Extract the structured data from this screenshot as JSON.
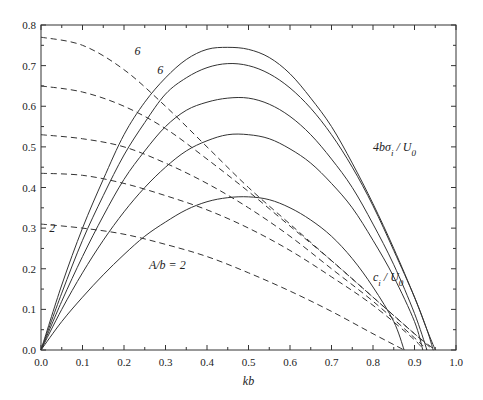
{
  "chart_data": {
    "type": "line",
    "title": "",
    "xlabel": "kb",
    "ylabel": "",
    "xlim": [
      0.0,
      1.0
    ],
    "ylim": [
      0.0,
      0.8
    ],
    "grid": false,
    "legend": "none",
    "x_ticks": [
      "0.0",
      "0.1",
      "0.2",
      "0.3",
      "0.4",
      "0.5",
      "0.6",
      "0.7",
      "0.8",
      "0.9",
      "1.0"
    ],
    "y_ticks": [
      "0.0",
      "0.1",
      "0.2",
      "0.3",
      "0.4",
      "0.5",
      "0.6",
      "0.7",
      "0.8"
    ],
    "annotations": [
      {
        "text": "6",
        "x": 0.28,
        "y": 0.68,
        "refers_to": "top solid curve"
      },
      {
        "text": "6",
        "x": 0.225,
        "y": 0.725,
        "refers_to": "top dashed curve"
      },
      {
        "text": "2",
        "x": 0.02,
        "y": 0.29,
        "refers_to": "bottom dashed curve"
      },
      {
        "text": "A/b = 2",
        "x": 0.26,
        "y": 0.2,
        "refers_to": "bottom solid curve"
      },
      {
        "text": "4bσ_i/U_0",
        "x": 0.8,
        "y": 0.49,
        "refers_to": "solid curves"
      },
      {
        "text": "c_i/U_0",
        "x": 0.8,
        "y": 0.17,
        "refers_to": "dashed curves"
      }
    ],
    "series": [
      {
        "name": "4bσ_i/U_0, A/b=6",
        "style": "solid",
        "x": [
          0,
          0.05,
          0.1,
          0.15,
          0.2,
          0.25,
          0.3,
          0.35,
          0.4,
          0.45,
          0.5,
          0.55,
          0.6,
          0.65,
          0.7,
          0.75,
          0.8,
          0.85,
          0.9,
          0.93,
          0.95
        ],
        "y": [
          0,
          0.16,
          0.3,
          0.42,
          0.53,
          0.61,
          0.67,
          0.715,
          0.74,
          0.745,
          0.74,
          0.72,
          0.68,
          0.62,
          0.55,
          0.46,
          0.36,
          0.25,
          0.13,
          0.05,
          0
        ]
      },
      {
        "name": "4bσ_i/U_0, A/b=5",
        "style": "solid",
        "x": [
          0,
          0.05,
          0.1,
          0.15,
          0.2,
          0.25,
          0.3,
          0.35,
          0.4,
          0.45,
          0.5,
          0.55,
          0.6,
          0.65,
          0.7,
          0.75,
          0.8,
          0.85,
          0.9,
          0.93,
          0.945
        ],
        "y": [
          0,
          0.14,
          0.27,
          0.38,
          0.48,
          0.56,
          0.63,
          0.67,
          0.695,
          0.705,
          0.7,
          0.68,
          0.645,
          0.595,
          0.53,
          0.45,
          0.355,
          0.245,
          0.13,
          0.05,
          0
        ]
      },
      {
        "name": "4bσ_i/U_0, A/b=4",
        "style": "solid",
        "x": [
          0,
          0.05,
          0.1,
          0.15,
          0.2,
          0.25,
          0.3,
          0.35,
          0.4,
          0.45,
          0.5,
          0.55,
          0.6,
          0.65,
          0.7,
          0.75,
          0.8,
          0.85,
          0.9,
          0.93
        ],
        "y": [
          0,
          0.12,
          0.23,
          0.33,
          0.42,
          0.49,
          0.55,
          0.59,
          0.61,
          0.62,
          0.62,
          0.605,
          0.575,
          0.53,
          0.47,
          0.4,
          0.31,
          0.21,
          0.09,
          0
        ]
      },
      {
        "name": "4bσ_i/U_0, A/b=3",
        "style": "solid",
        "x": [
          0,
          0.05,
          0.1,
          0.15,
          0.2,
          0.25,
          0.3,
          0.35,
          0.4,
          0.45,
          0.5,
          0.55,
          0.6,
          0.65,
          0.7,
          0.75,
          0.8,
          0.85,
          0.9,
          0.92
        ],
        "y": [
          0,
          0.1,
          0.19,
          0.27,
          0.34,
          0.4,
          0.45,
          0.49,
          0.515,
          0.53,
          0.53,
          0.52,
          0.495,
          0.46,
          0.41,
          0.35,
          0.27,
          0.18,
          0.07,
          0
        ]
      },
      {
        "name": "4bσ_i/U_0, A/b=2",
        "style": "solid",
        "x": [
          0,
          0.05,
          0.1,
          0.15,
          0.2,
          0.25,
          0.3,
          0.35,
          0.4,
          0.45,
          0.5,
          0.55,
          0.6,
          0.65,
          0.7,
          0.75,
          0.8,
          0.85,
          0.875
        ],
        "y": [
          0,
          0.07,
          0.13,
          0.185,
          0.235,
          0.28,
          0.315,
          0.345,
          0.365,
          0.375,
          0.377,
          0.37,
          0.35,
          0.32,
          0.28,
          0.225,
          0.155,
          0.07,
          0
        ]
      },
      {
        "name": "c_i/U_0, A/b=6",
        "style": "dashed",
        "x": [
          0,
          0.1,
          0.2,
          0.3,
          0.4,
          0.5,
          0.6,
          0.7,
          0.8,
          0.9,
          0.95
        ],
        "y": [
          0.77,
          0.75,
          0.69,
          0.6,
          0.5,
          0.4,
          0.31,
          0.22,
          0.13,
          0.04,
          0
        ]
      },
      {
        "name": "c_i/U_0, A/b=5",
        "style": "dashed",
        "x": [
          0,
          0.1,
          0.2,
          0.3,
          0.4,
          0.5,
          0.6,
          0.7,
          0.8,
          0.9,
          0.945
        ],
        "y": [
          0.65,
          0.635,
          0.6,
          0.545,
          0.47,
          0.39,
          0.305,
          0.22,
          0.13,
          0.04,
          0
        ]
      },
      {
        "name": "c_i/U_0, A/b=4",
        "style": "dashed",
        "x": [
          0,
          0.1,
          0.2,
          0.3,
          0.4,
          0.5,
          0.6,
          0.7,
          0.8,
          0.9,
          0.93
        ],
        "y": [
          0.53,
          0.52,
          0.5,
          0.46,
          0.41,
          0.35,
          0.28,
          0.2,
          0.12,
          0.03,
          0
        ]
      },
      {
        "name": "c_i/U_0, A/b=3",
        "style": "dashed",
        "x": [
          0,
          0.1,
          0.2,
          0.3,
          0.4,
          0.5,
          0.6,
          0.7,
          0.8,
          0.9,
          0.92
        ],
        "y": [
          0.435,
          0.43,
          0.41,
          0.38,
          0.345,
          0.3,
          0.245,
          0.18,
          0.11,
          0.025,
          0
        ]
      },
      {
        "name": "c_i/U_0, A/b=2",
        "style": "dashed",
        "x": [
          0,
          0.1,
          0.2,
          0.3,
          0.4,
          0.5,
          0.6,
          0.7,
          0.8,
          0.875
        ],
        "y": [
          0.31,
          0.3,
          0.285,
          0.26,
          0.23,
          0.19,
          0.145,
          0.095,
          0.04,
          0
        ]
      }
    ]
  }
}
